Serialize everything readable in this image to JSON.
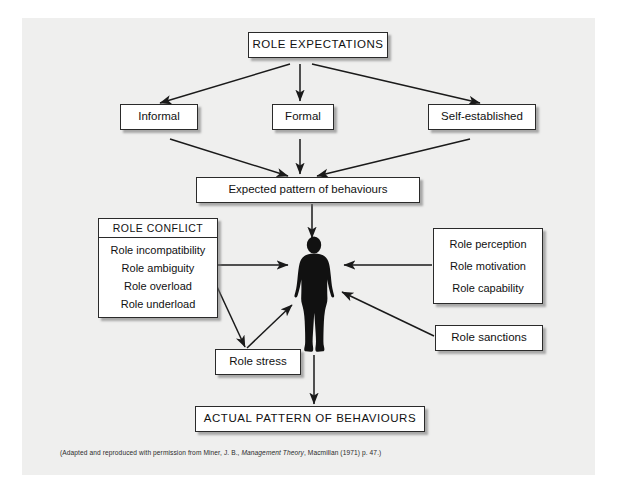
{
  "diagram": {
    "background_color": "#efefee",
    "page_color": "#ffffff",
    "box_fill": "#ffffff",
    "box_border": "#2a2a2a",
    "figure_color": "#111111",
    "nodes": {
      "role_expectations": "ROLE EXPECTATIONS",
      "informal": "Informal",
      "formal": "Formal",
      "self_established": "Self-established",
      "expected_pattern": "Expected pattern of behaviours",
      "role_conflict_title": "ROLE CONFLICT",
      "role_conflict_items": [
        "Role incompatibility",
        "Role ambiguity",
        "Role overload",
        "Role underload"
      ],
      "role_factors_items": [
        "Role perception",
        "Role motivation",
        "Role capability"
      ],
      "role_sanctions": "Role sanctions",
      "role_stress": "Role stress",
      "actual_pattern": "ACTUAL PATTERN OF BEHAVIOURS",
      "person_figure": "human-silhouette"
    },
    "caption": {
      "before": "(Adapted and reproduced with permission from Miner, J. B., ",
      "italic": "Management Theory",
      "after": ", Macmillan (1971) p. 47.)"
    }
  }
}
